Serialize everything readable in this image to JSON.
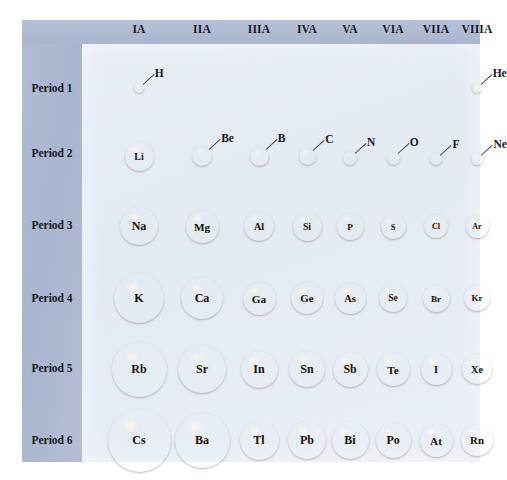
{
  "figure": {
    "colors": {
      "sidebar": "#aeb8d0",
      "panel": "#e7edf5",
      "sphere_highlight": "#fbe2cf",
      "sphere_mid": "#d3753f",
      "sphere_edge": "#8e3018",
      "text": "#15181f"
    }
  },
  "groups": [
    {
      "label": "IA",
      "x": 117
    },
    {
      "label": "IIA",
      "x": 180
    },
    {
      "label": "IIIA",
      "x": 237
    },
    {
      "label": "IVA",
      "x": 285
    },
    {
      "label": "VA",
      "x": 328
    },
    {
      "label": "VIA",
      "x": 371
    },
    {
      "label": "VIIA",
      "x": 414
    },
    {
      "label": "VIIIA",
      "x": 455
    }
  ],
  "periods": [
    {
      "label": "Period 1",
      "y": 68
    },
    {
      "label": "Period 2",
      "y": 133
    },
    {
      "label": "Period 3",
      "y": 205
    },
    {
      "label": "Period 4",
      "y": 278
    },
    {
      "label": "Period 5",
      "y": 348
    },
    {
      "label": "Period 6",
      "y": 420
    }
  ],
  "chart_data": {
    "type": "diagram",
    "xlabel": "Group",
    "ylabel": "Period",
    "encoding": "sphere diameter proportional to atomic radius",
    "categories": [
      "IA",
      "IIA",
      "IIIA",
      "IVA",
      "VA",
      "VIA",
      "VIIA",
      "VIIIA"
    ],
    "rows": [
      "Period 1",
      "Period 2",
      "Period 3",
      "Period 4",
      "Period 5",
      "Period 6"
    ],
    "elements": [
      {
        "symbol": "H",
        "period": 1,
        "group": "IA",
        "cx": 117,
        "cy": 68,
        "d": 10,
        "label": "callout"
      },
      {
        "symbol": "He",
        "period": 1,
        "group": "VIIIA",
        "cx": 455,
        "cy": 68,
        "d": 10,
        "label": "callout"
      },
      {
        "symbol": "Li",
        "period": 2,
        "group": "IA",
        "cx": 117,
        "cy": 136,
        "d": 29,
        "label": "inside"
      },
      {
        "symbol": "Be",
        "period": 2,
        "group": "IIA",
        "cx": 180,
        "cy": 136,
        "d": 20,
        "label": "callout"
      },
      {
        "symbol": "B",
        "period": 2,
        "group": "IIIA",
        "cx": 237,
        "cy": 136,
        "d": 19,
        "label": "callout"
      },
      {
        "symbol": "C",
        "period": 2,
        "group": "IVA",
        "cx": 285,
        "cy": 136,
        "d": 17,
        "label": "callout"
      },
      {
        "symbol": "N",
        "period": 2,
        "group": "VA",
        "cx": 328,
        "cy": 138,
        "d": 14,
        "label": "callout"
      },
      {
        "symbol": "O",
        "period": 2,
        "group": "VIA",
        "cx": 371,
        "cy": 138,
        "d": 13,
        "label": "callout"
      },
      {
        "symbol": "F",
        "period": 2,
        "group": "VIIA",
        "cx": 414,
        "cy": 139,
        "d": 12,
        "label": "callout"
      },
      {
        "symbol": "Ne",
        "period": 2,
        "group": "VIIIA",
        "cx": 455,
        "cy": 139,
        "d": 12,
        "label": "callout"
      },
      {
        "symbol": "Na",
        "period": 3,
        "group": "IA",
        "cx": 117,
        "cy": 206,
        "d": 38,
        "label": "inside"
      },
      {
        "symbol": "Mg",
        "period": 3,
        "group": "IIA",
        "cx": 180,
        "cy": 206,
        "d": 33,
        "label": "inside"
      },
      {
        "symbol": "Al",
        "period": 3,
        "group": "IIIA",
        "cx": 237,
        "cy": 206,
        "d": 30,
        "label": "inside"
      },
      {
        "symbol": "Si",
        "period": 3,
        "group": "IVA",
        "cx": 285,
        "cy": 206,
        "d": 29,
        "label": "inside"
      },
      {
        "symbol": "P",
        "period": 3,
        "group": "VA",
        "cx": 328,
        "cy": 206,
        "d": 27,
        "label": "inside"
      },
      {
        "symbol": "S",
        "period": 3,
        "group": "VIA",
        "cx": 371,
        "cy": 206,
        "d": 25,
        "label": "inside"
      },
      {
        "symbol": "Cl",
        "period": 3,
        "group": "VIIA",
        "cx": 414,
        "cy": 206,
        "d": 24,
        "label": "inside"
      },
      {
        "symbol": "Ar",
        "period": 3,
        "group": "VIIIA",
        "cx": 455,
        "cy": 206,
        "d": 23,
        "label": "inside"
      },
      {
        "symbol": "K",
        "period": 4,
        "group": "IA",
        "cx": 117,
        "cy": 278,
        "d": 50,
        "label": "inside"
      },
      {
        "symbol": "Ca",
        "period": 4,
        "group": "IIA",
        "cx": 180,
        "cy": 278,
        "d": 42,
        "label": "inside"
      },
      {
        "symbol": "Ga",
        "period": 4,
        "group": "IIIA",
        "cx": 237,
        "cy": 278,
        "d": 33,
        "label": "inside"
      },
      {
        "symbol": "Ge",
        "period": 4,
        "group": "IVA",
        "cx": 285,
        "cy": 278,
        "d": 32,
        "label": "inside"
      },
      {
        "symbol": "As",
        "period": 4,
        "group": "VA",
        "cx": 328,
        "cy": 278,
        "d": 31,
        "label": "inside"
      },
      {
        "symbol": "Se",
        "period": 4,
        "group": "VIA",
        "cx": 371,
        "cy": 278,
        "d": 28,
        "label": "inside"
      },
      {
        "symbol": "Br",
        "period": 4,
        "group": "VIIA",
        "cx": 414,
        "cy": 278,
        "d": 27,
        "label": "inside"
      },
      {
        "symbol": "Kr",
        "period": 4,
        "group": "VIIIA",
        "cx": 455,
        "cy": 278,
        "d": 26,
        "label": "inside"
      },
      {
        "symbol": "Rb",
        "period": 5,
        "group": "IA",
        "cx": 117,
        "cy": 349,
        "d": 55,
        "label": "inside"
      },
      {
        "symbol": "Sr",
        "period": 5,
        "group": "IIA",
        "cx": 180,
        "cy": 349,
        "d": 48,
        "label": "inside"
      },
      {
        "symbol": "In",
        "period": 5,
        "group": "IIIA",
        "cx": 237,
        "cy": 349,
        "d": 37,
        "label": "inside"
      },
      {
        "symbol": "Sn",
        "period": 5,
        "group": "IVA",
        "cx": 285,
        "cy": 349,
        "d": 36,
        "label": "inside"
      },
      {
        "symbol": "Sb",
        "period": 5,
        "group": "VA",
        "cx": 328,
        "cy": 349,
        "d": 35,
        "label": "inside"
      },
      {
        "symbol": "Te",
        "period": 5,
        "group": "VIA",
        "cx": 371,
        "cy": 349,
        "d": 33,
        "label": "inside"
      },
      {
        "symbol": "I",
        "period": 5,
        "group": "VIIA",
        "cx": 414,
        "cy": 349,
        "d": 31,
        "label": "inside"
      },
      {
        "symbol": "Xe",
        "period": 5,
        "group": "VIIIA",
        "cx": 455,
        "cy": 349,
        "d": 30,
        "label": "inside"
      },
      {
        "symbol": "Cs",
        "period": 6,
        "group": "IA",
        "cx": 117,
        "cy": 420,
        "d": 63,
        "label": "inside"
      },
      {
        "symbol": "Ba",
        "period": 6,
        "group": "IIA",
        "cx": 180,
        "cy": 420,
        "d": 55,
        "label": "inside"
      },
      {
        "symbol": "Tl",
        "period": 6,
        "group": "IIIA",
        "cx": 237,
        "cy": 420,
        "d": 39,
        "label": "inside"
      },
      {
        "symbol": "Pb",
        "period": 6,
        "group": "IVA",
        "cx": 285,
        "cy": 420,
        "d": 38,
        "label": "inside"
      },
      {
        "symbol": "Bi",
        "period": 6,
        "group": "VA",
        "cx": 328,
        "cy": 420,
        "d": 37,
        "label": "inside"
      },
      {
        "symbol": "Po",
        "period": 6,
        "group": "VIA",
        "cx": 371,
        "cy": 420,
        "d": 35,
        "label": "inside"
      },
      {
        "symbol": "At",
        "period": 6,
        "group": "VIIA",
        "cx": 414,
        "cy": 420,
        "d": 33,
        "label": "inside"
      },
      {
        "symbol": "Rn",
        "period": 6,
        "group": "VIIIA",
        "cx": 455,
        "cy": 420,
        "d": 32,
        "label": "inside"
      }
    ]
  }
}
